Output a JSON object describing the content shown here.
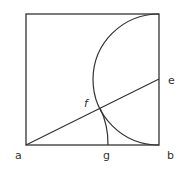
{
  "diagram": {
    "type": "geometric-construction",
    "shapes": [
      "square",
      "semicircle",
      "diagonal-line",
      "arc"
    ],
    "labels": {
      "a": "a",
      "b": "b",
      "e": "e",
      "f": "f",
      "g": "g"
    },
    "colors": {
      "stroke": "#333333",
      "background": "#ffffff"
    }
  }
}
